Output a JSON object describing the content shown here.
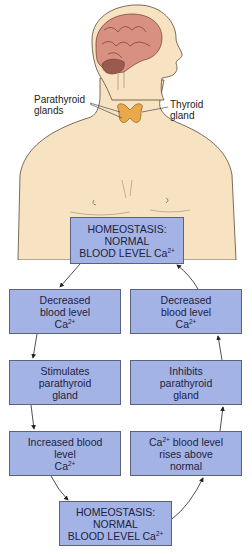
{
  "figure": {
    "labels": {
      "parathyroid": [
        "Parathyroid",
        "glands"
      ],
      "thyroid": [
        "Thyroid",
        "gland"
      ]
    },
    "colors": {
      "skin": "#f7e2c2",
      "brain": "#d89080",
      "thyroid": "#e9a94a",
      "box_fill": "#a3b3e6",
      "box_border": "#5a627e",
      "text": "#1e2240"
    }
  },
  "boxes": {
    "top": {
      "lines": [
        "HOMEOSTASIS:",
        "NORMAL",
        "BLOOD LEVEL Ca"
      ],
      "sup": "2+"
    },
    "left1": {
      "lines": [
        "Decreased",
        "blood level",
        "Ca"
      ],
      "sup": "2+"
    },
    "left2": {
      "lines": [
        "Stimulates",
        "parathyroid",
        "gland"
      ]
    },
    "left3": {
      "lines": [
        "Increased blood",
        "level",
        "Ca"
      ],
      "sup": "2+"
    },
    "right1": {
      "lines": [
        "Decreased",
        "blood level",
        "Ca"
      ],
      "sup": "2+"
    },
    "right2": {
      "lines": [
        "Inhibits",
        "parathyroid",
        "gland"
      ]
    },
    "right3": {
      "line1_prefix": "Ca",
      "sup": "2+",
      "line1_suffix": " blood level",
      "lines": [
        "rises above",
        "normal"
      ]
    },
    "bottom": {
      "lines": [
        "HOMEOSTASIS:",
        "NORMAL",
        "BLOOD LEVEL Ca"
      ],
      "sup": "2+"
    }
  }
}
